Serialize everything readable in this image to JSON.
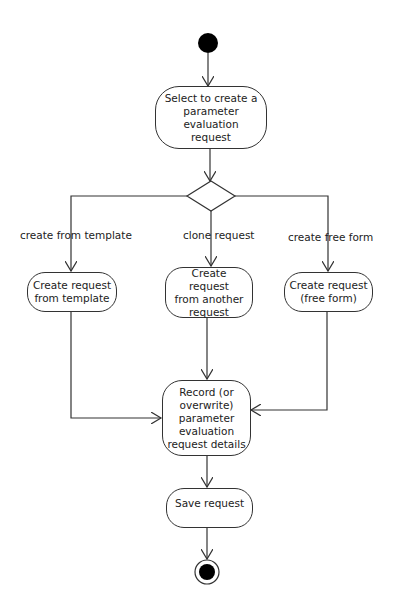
{
  "diagram": {
    "type": "UML activity diagram",
    "initial_node": {
      "label": "start"
    },
    "decision_node": {
      "label": "decision"
    },
    "final_node": {
      "label": "end"
    },
    "actions": {
      "select": "Select to create a\nparameter evaluation\nrequest",
      "from_template": "Create request\nfrom template",
      "from_another": "Create request\nfrom another\nrequest",
      "free_form": "Create request\n(free form)",
      "record": "Record (or\noverwrite)\nparameter\nevaluation\nrequest details",
      "save": "Save request"
    },
    "guards": {
      "template": "create from template",
      "clone": "clone request",
      "free_form": "create free form"
    },
    "colors": {
      "stroke": "#333333",
      "fill": "#ffffff",
      "node_fill": "#000000"
    }
  }
}
